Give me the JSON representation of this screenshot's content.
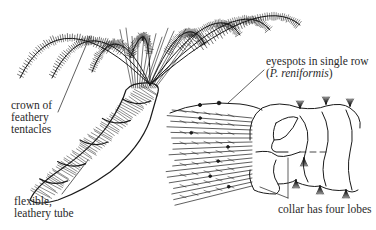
{
  "diagram": {
    "ink_color": "#1a1a1a",
    "background_color": "#ffffff",
    "labels": {
      "crown": [
        "crown of",
        "feathery",
        "tentacles"
      ],
      "tube": [
        "flexible,",
        "leathery tube"
      ],
      "eyespots": {
        "line1": "eyespots in single row",
        "open_paren": "(",
        "species": "P. reniformis",
        "close_paren": ")"
      },
      "collar": "collar has four lobes"
    }
  }
}
